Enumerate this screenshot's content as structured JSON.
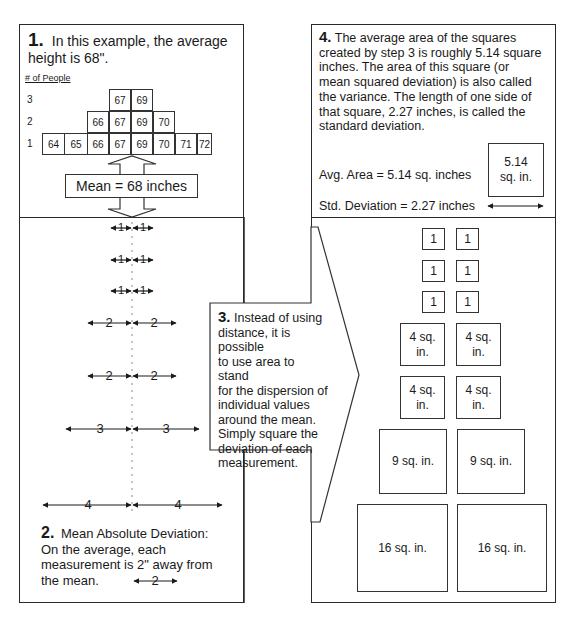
{
  "panel1": {
    "step": "1.",
    "text_line1": "In this example, the average",
    "text_line2": "height is 68\".",
    "y_axis_label": "# of People",
    "y_ticks": [
      "3",
      "2",
      "1"
    ],
    "histogram": {
      "row3": [
        "67",
        "69"
      ],
      "row2": [
        "66",
        "67",
        "69",
        "70"
      ],
      "row1": [
        "64",
        "65",
        "66",
        "67",
        "69",
        "70",
        "71",
        "72"
      ]
    },
    "mean_label": "Mean = 68 inches"
  },
  "panel2": {
    "deviation_arrows": [
      {
        "left": "1",
        "right": "1"
      },
      {
        "left": "1",
        "right": "1"
      },
      {
        "left": "1",
        "right": "1"
      },
      {
        "left": "2",
        "right": "2"
      },
      {
        "left": "2",
        "right": "2"
      },
      {
        "left": "3",
        "right": "3"
      },
      {
        "left": "4",
        "right": "4"
      }
    ],
    "step": "2.",
    "title": "Mean Absolute Deviation:",
    "text_line1": "On the average, each",
    "text_line2": "measurement is 2\" away from",
    "text_line3": "the mean.",
    "mad_arrow_label": "2"
  },
  "panel3": {
    "step": "3.",
    "lines": [
      "Instead of using",
      "distance, it is possible",
      "to use area to stand",
      "for the dispersion of",
      "individual values",
      "around the mean.",
      "Simply square the",
      "deviation of each",
      "measurement."
    ]
  },
  "panel4": {
    "step": "4.",
    "lines": [
      "The average area of the squares",
      "created by step 3 is roughly 5.14 square",
      "inches.  The area of this square (or",
      "mean squared deviation) is also called",
      "the variance.  The length of one side of",
      "that square, 2.27 inches, is called the",
      "standard deviation."
    ],
    "avg_area_label": "Avg. Area = 5.14 sq. inches",
    "std_dev_label": "Std. Deviation = 2.27 inches",
    "avg_square_line1": "5.14",
    "avg_square_line2": "sq. in."
  },
  "squares": {
    "one": "1",
    "four_line1": "4 sq.",
    "four_line2": "in.",
    "nine": "9 sq. in.",
    "sixteen": "16 sq. in."
  }
}
